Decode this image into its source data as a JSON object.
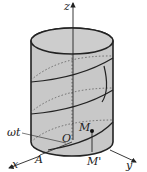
{
  "diagram": {
    "type": "3D cylinder with helix",
    "labels": {
      "z_axis": "z",
      "x_axis": "x",
      "y_axis": "y",
      "origin": "O",
      "point_m": "M",
      "point_m_prime": "M'",
      "point_a": "A",
      "angle": "ωt"
    },
    "colors": {
      "cylinder_fill": "#c8c8c8",
      "stroke": "#222222",
      "background": "#ffffff"
    }
  }
}
